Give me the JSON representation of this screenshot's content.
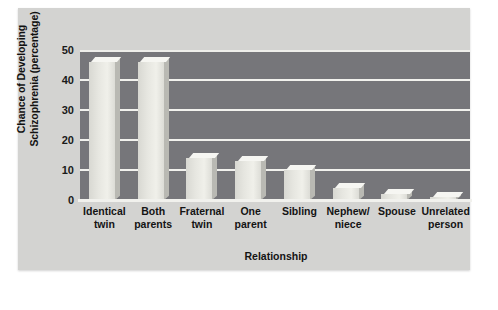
{
  "chart_data": {
    "type": "bar",
    "title": "",
    "xlabel": "Relationship",
    "ylabel": "Chance of Developing Schizophrenia (percentage)",
    "ylabel_line1": "Chance of Developing",
    "ylabel_line2": "Schizophrenia (percentage)",
    "categories": [
      "Identical twin",
      "Both parents",
      "Fraternal twin",
      "One parent",
      "Sibling",
      "Nephew/ niece",
      "Spouse",
      "Unrelated person"
    ],
    "category_lines": [
      [
        "Identical",
        "twin"
      ],
      [
        "Both",
        "parents"
      ],
      [
        "Fraternal",
        "twin"
      ],
      [
        "One",
        "parent"
      ],
      [
        "Sibling",
        ""
      ],
      [
        "Nephew/",
        "niece"
      ],
      [
        "Spouse",
        ""
      ],
      [
        "Unrelated",
        "person"
      ]
    ],
    "values": [
      46,
      46,
      14,
      13,
      10,
      4,
      2,
      1
    ],
    "ylim": [
      0,
      50
    ],
    "yticks": [
      50,
      40,
      30,
      20,
      10,
      0
    ],
    "grid": true,
    "legend": "none"
  },
  "style": {
    "page_background": "#ffffff",
    "card_background": "#d3d3d1",
    "plot_background": "#76767a",
    "gridline_color": "#f2f2ee",
    "bar_face_color": "#e6e6e0",
    "bar_top_color": "#f6f6f2",
    "bar_side_color": "#b9b9b3",
    "text_color": "#141414"
  }
}
